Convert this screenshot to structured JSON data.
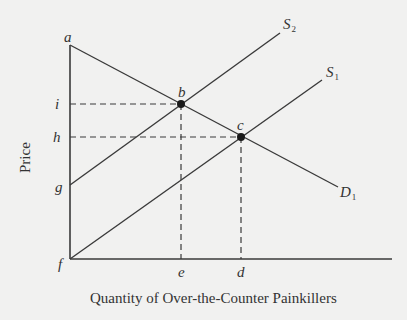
{
  "diagram": {
    "type": "supply-demand",
    "axes": {
      "x_title": "Quantity of Over-the-Counter Painkillers",
      "y_title": "Price"
    },
    "curves": [
      {
        "id": "S2",
        "label": "S",
        "subscript": "2",
        "kind": "supply"
      },
      {
        "id": "S1",
        "label": "S",
        "subscript": "1",
        "kind": "supply"
      },
      {
        "id": "D1",
        "label": "D",
        "subscript": "1",
        "kind": "demand"
      }
    ],
    "points": {
      "a": "a",
      "b": "b",
      "c": "c",
      "d": "d",
      "e": "e",
      "f": "f",
      "g": "g",
      "h": "h",
      "i": "i"
    },
    "equilibria": [
      {
        "point": "b",
        "curves": [
          "S2",
          "D1"
        ],
        "price_label": "i",
        "quantity_label": "e"
      },
      {
        "point": "c",
        "curves": [
          "S1",
          "D1"
        ],
        "price_label": "h",
        "quantity_label": "d"
      }
    ],
    "colors": {
      "line": "#3a3a3a",
      "background": "#f1f1f0"
    }
  }
}
